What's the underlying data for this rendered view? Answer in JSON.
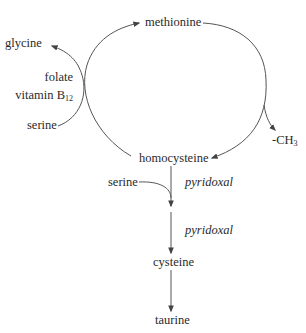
{
  "diagram": {
    "type": "metabolic-pathway",
    "cycle": {
      "top_node": "methionine",
      "bottom_node": "homocysteine",
      "left_inputs": {
        "input": "serine",
        "output": "glycine",
        "cofactor_line1": "folate",
        "cofactor_line2_main": "vitamin B",
        "cofactor_line2_sub": "12"
      },
      "right_output": {
        "main": "-CH",
        "sub": "3"
      }
    },
    "transsulfuration": {
      "input": "serine",
      "cofactor_1": "pyridoxal",
      "cofactor_2": "pyridoxal",
      "node_1": "cysteine",
      "node_2": "taurine"
    },
    "colors": {
      "line": "#555555",
      "text": "#2a2a2a",
      "background": "#ffffff"
    }
  }
}
